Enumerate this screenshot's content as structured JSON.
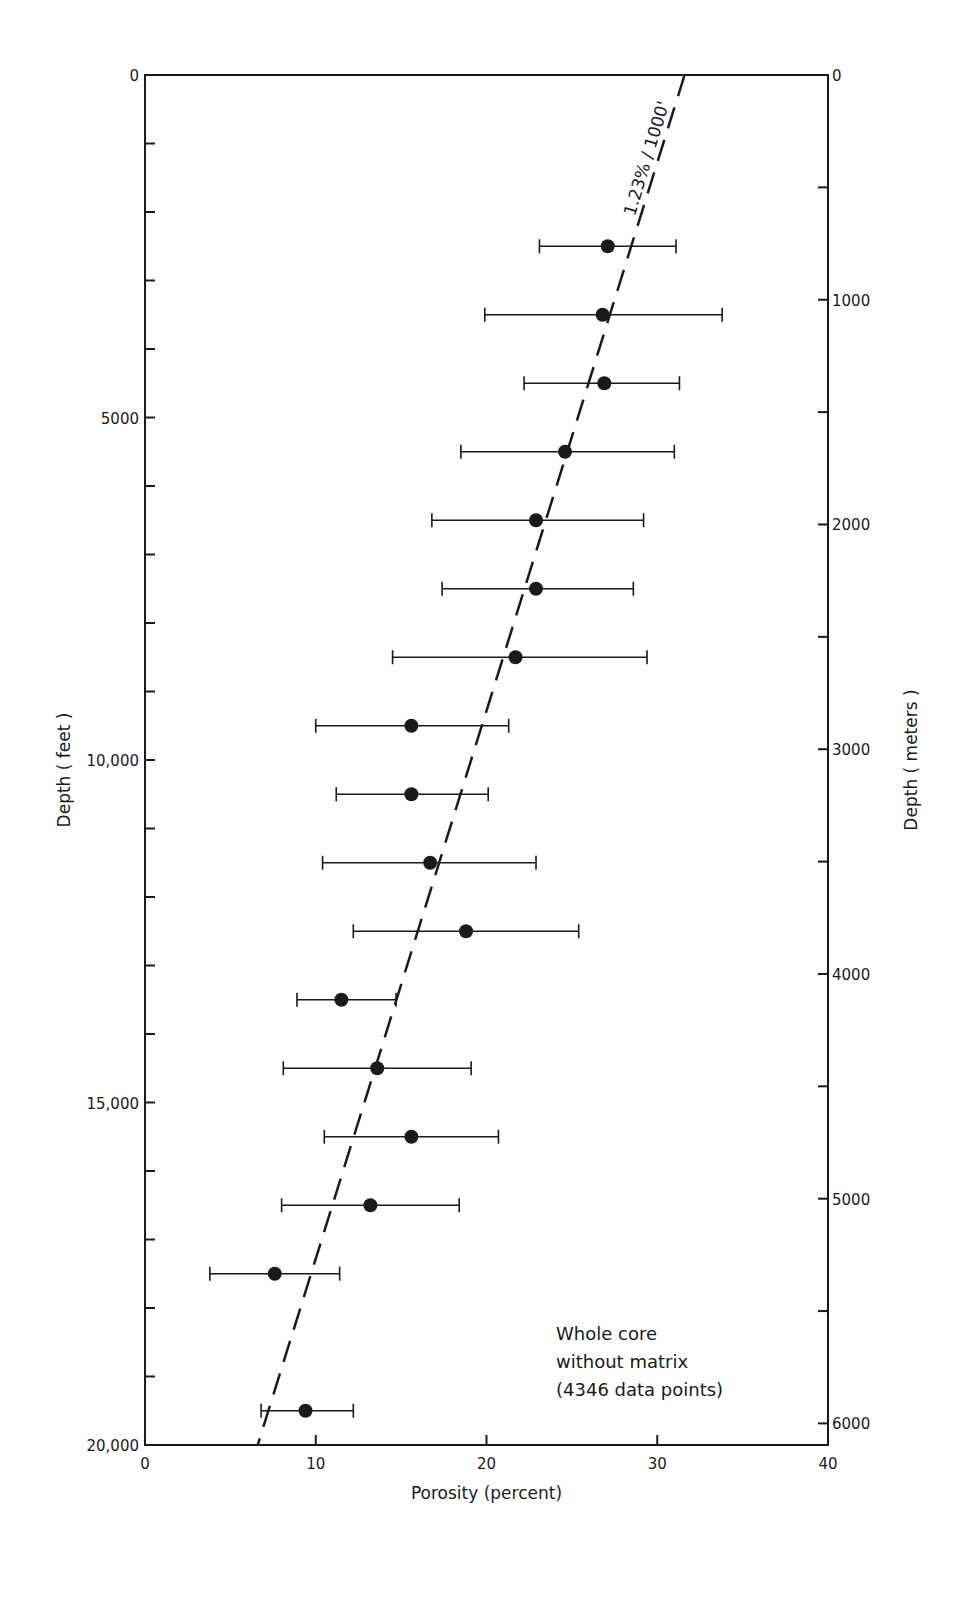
{
  "chart_data": {
    "type": "scatter",
    "title": "",
    "xlabel": "Porosity (percent)",
    "ylabel": "Depth ( feet )",
    "ylabel_right": "Depth ( meters )",
    "xlim": [
      0,
      40
    ],
    "ylim": [
      20000,
      0
    ],
    "ylim_right_meters": [
      6096,
      0
    ],
    "x_ticks": [
      0,
      10,
      20,
      30,
      40
    ],
    "y_ticks_feet": [
      0,
      5000,
      10000,
      15000,
      20000
    ],
    "y_tick_labels_feet": [
      "0",
      "5000",
      "10,000",
      "15,000",
      "20,000"
    ],
    "y_ticks_meters": [
      0,
      1000,
      2000,
      3000,
      4000,
      5000,
      6000
    ],
    "y_tick_labels_meters": [
      "0",
      "1000",
      "2000",
      "3000",
      "4000",
      "5000",
      "6000"
    ],
    "grid": false,
    "trend_line": {
      "label": "1.23% / 1000'",
      "style": "dashed",
      "x_at_0ft": 31.6,
      "x_at_20000ft": 6.6
    },
    "annotation": [
      "Whole core",
      "without matrix",
      "(4346 data points)"
    ],
    "series": [
      {
        "name": "Whole core without matrix",
        "points": [
          {
            "depth_ft": 2500,
            "porosity": 27.1,
            "min": 23.1,
            "max": 31.1
          },
          {
            "depth_ft": 3500,
            "porosity": 26.8,
            "min": 19.9,
            "max": 33.8
          },
          {
            "depth_ft": 4500,
            "porosity": 26.9,
            "min": 22.2,
            "max": 31.3
          },
          {
            "depth_ft": 5500,
            "porosity": 24.6,
            "min": 18.5,
            "max": 31.0
          },
          {
            "depth_ft": 6500,
            "porosity": 22.9,
            "min": 16.8,
            "max": 29.2
          },
          {
            "depth_ft": 7500,
            "porosity": 22.9,
            "min": 17.4,
            "max": 28.6
          },
          {
            "depth_ft": 8500,
            "porosity": 21.7,
            "min": 14.5,
            "max": 29.4
          },
          {
            "depth_ft": 9500,
            "porosity": 15.6,
            "min": 10.0,
            "max": 21.3
          },
          {
            "depth_ft": 10500,
            "porosity": 15.6,
            "min": 11.2,
            "max": 20.1
          },
          {
            "depth_ft": 11500,
            "porosity": 16.7,
            "min": 10.4,
            "max": 22.9
          },
          {
            "depth_ft": 12500,
            "porosity": 18.8,
            "min": 12.2,
            "max": 25.4
          },
          {
            "depth_ft": 13500,
            "porosity": 11.5,
            "min": 8.9,
            "max": 14.7
          },
          {
            "depth_ft": 14500,
            "porosity": 13.6,
            "min": 8.1,
            "max": 19.1
          },
          {
            "depth_ft": 15500,
            "porosity": 15.6,
            "min": 10.5,
            "max": 20.7
          },
          {
            "depth_ft": 16500,
            "porosity": 13.2,
            "min": 8.0,
            "max": 18.4
          },
          {
            "depth_ft": 17500,
            "porosity": 7.6,
            "min": 3.8,
            "max": 11.4
          },
          {
            "depth_ft": 19500,
            "porosity": 9.4,
            "min": 6.8,
            "max": 12.2
          }
        ]
      }
    ]
  }
}
